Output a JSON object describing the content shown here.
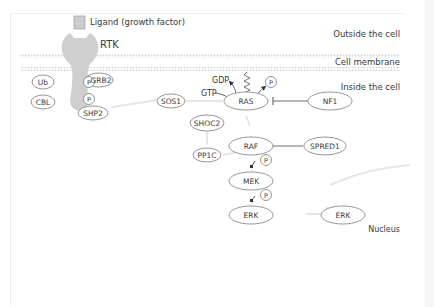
{
  "regions": {
    "outside": "Outside the cell",
    "membrane": "Cell membrane",
    "inside": "Inside the cell",
    "nucleus": "Nucleus"
  },
  "ligand": {
    "label": "Ligand (growth factor)"
  },
  "receptor": {
    "label": "RTK"
  },
  "proteins": {
    "ub": "Ub",
    "grb2": "GRB2",
    "cbl": "CBL",
    "shp2": "SHP2",
    "sos1": "SOS1",
    "shoc2": "SHOC2",
    "pp1c": "PP1C",
    "ras": "RAS",
    "nf1": "NF1",
    "raf": "RAF",
    "spred1": "SPRED1",
    "mek": "MEK",
    "erk": "ERK",
    "erk_nuclear": "ERK"
  },
  "phospho": {
    "label": "P"
  },
  "nucleotides": {
    "gtp": "GTP",
    "gdp": "GDP"
  },
  "colors": {
    "membrane": "#d6d6d6",
    "receptor": "#cfcfcf",
    "node_border": "#8a8a8a",
    "text": "#3a3a3a",
    "inhibition": "#6e6e6e",
    "faint_arrow": "#e4e4e4"
  }
}
